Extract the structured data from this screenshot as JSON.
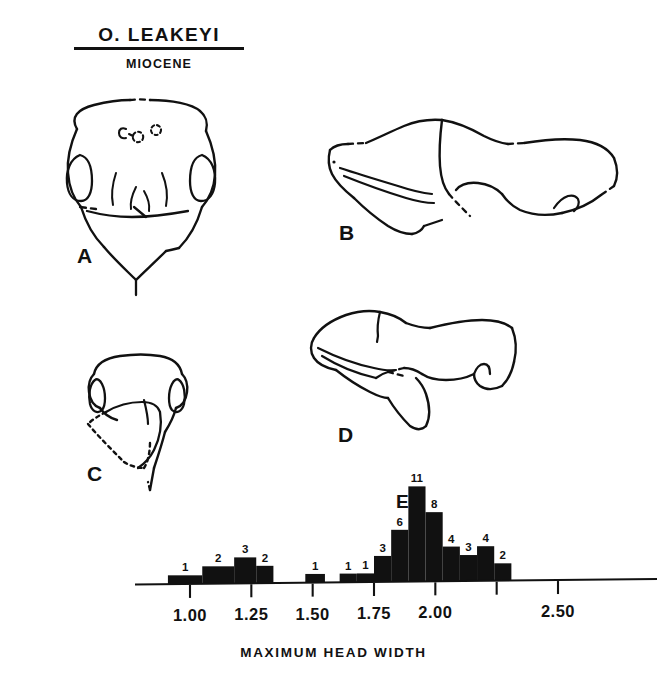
{
  "heading": {
    "species_name": "O. LEAKEYI",
    "epoch_name": "MIOCENE"
  },
  "figure_labels": {
    "a": "A",
    "b": "B",
    "c": "C",
    "d": "D",
    "e": "E"
  },
  "figure_captions": {
    "a": "ant head, full-face (frontal) view",
    "b": "mesosoma, lateral view",
    "c": "head, oblique/partial view",
    "d": "mesosoma, lateral view (second specimen)",
    "e": "histogram of maximum head width"
  },
  "axis_caption": "MAXIMUM HEAD WIDTH",
  "colors": {
    "ink": "#111111",
    "paper": "#ffffff",
    "bar_fill": "#111111"
  },
  "chart_data": {
    "type": "bar",
    "title": "",
    "subtitle": "",
    "xlabel": "MAXIMUM HEAD WIDTH",
    "ylabel": "",
    "grid": false,
    "legend": null,
    "panel_letter": "E",
    "bin_width": 0.05,
    "xlim": [
      0.85,
      2.72
    ],
    "ylim": [
      0,
      11
    ],
    "tick_labels": [
      "1.00",
      "1.25",
      "1.50",
      "1.75",
      "2.00",
      "2.50"
    ],
    "tick_values": [
      1.0,
      1.25,
      1.5,
      1.75,
      2.0,
      2.5
    ],
    "unlabeled_tick_values": [
      2.25
    ],
    "categories": [
      "0.90",
      "0.95",
      "1.00",
      "1.05",
      "1.10",
      "1.15",
      "1.20",
      "1.25",
      "1.30",
      "1.50",
      "1.55",
      "1.75",
      "1.80",
      "1.85",
      "1.90",
      "1.95",
      "2.00",
      "2.05",
      "2.10",
      "2.15",
      "2.20",
      "2.25",
      "2.30",
      "2.35",
      "2.40",
      "2.45",
      "2.50",
      "2.55",
      "2.60"
    ],
    "bars": [
      {
        "bin_start": 0.91,
        "bin_end": 1.05,
        "value": 1,
        "label": "1"
      },
      {
        "bin_start": 1.05,
        "bin_end": 1.18,
        "value": 2,
        "label": "2"
      },
      {
        "bin_start": 1.18,
        "bin_end": 1.27,
        "value": 3,
        "label": "3"
      },
      {
        "bin_start": 1.27,
        "bin_end": 1.34,
        "value": 2,
        "label": "2"
      },
      {
        "bin_start": 1.47,
        "bin_end": 1.55,
        "value": 1,
        "label": "1"
      },
      {
        "bin_start": 1.61,
        "bin_end": 1.68,
        "value": 1,
        "label": "1"
      },
      {
        "bin_start": 1.68,
        "bin_end": 1.75,
        "value": 1,
        "label": "1"
      },
      {
        "bin_start": 1.75,
        "bin_end": 1.82,
        "value": 3,
        "label": "3"
      },
      {
        "bin_start": 1.82,
        "bin_end": 1.89,
        "value": 6,
        "label": "6"
      },
      {
        "bin_start": 1.89,
        "bin_end": 1.96,
        "value": 11,
        "label": "11"
      },
      {
        "bin_start": 1.96,
        "bin_end": 2.03,
        "value": 8,
        "label": "8"
      },
      {
        "bin_start": 2.03,
        "bin_end": 2.1,
        "value": 4,
        "label": "4"
      },
      {
        "bin_start": 2.1,
        "bin_end": 2.17,
        "value": 3,
        "label": "3"
      },
      {
        "bin_start": 2.17,
        "bin_end": 2.24,
        "value": 4,
        "label": "4"
      },
      {
        "bin_start": 2.24,
        "bin_end": 2.31,
        "value": 2,
        "label": "2"
      }
    ],
    "total_count": 52,
    "annotations": [
      "E"
    ]
  }
}
